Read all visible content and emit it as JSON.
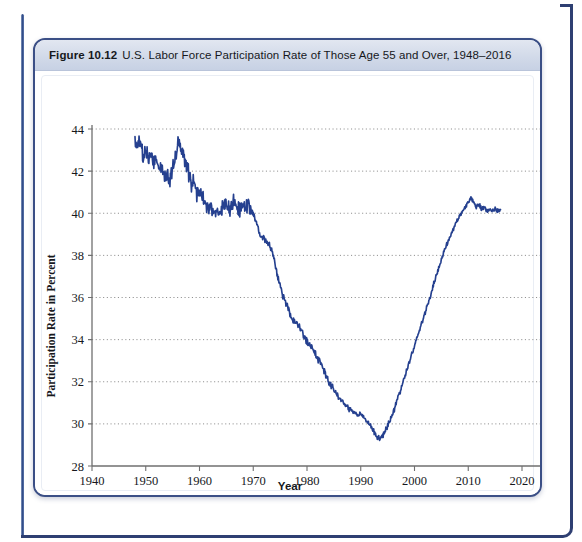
{
  "figure": {
    "number": "Figure 10.12",
    "title": "U.S. Labor Force Participation Rate of Those Age 55 and Over, 1948–2016"
  },
  "colors": {
    "line": "#25408f",
    "grid": "#8b8b8b",
    "axis": "#6f6f6f",
    "card_border": "#3b4f86",
    "header_band": "#d2dae9",
    "page_rule": "#2f4a86"
  },
  "chart_data": {
    "type": "line",
    "title": "U.S. Labor Force Participation Rate of Those Age 55 and Over, 1948–2016",
    "xlabel": "Year",
    "ylabel": "Participation Rate in Percent",
    "xlim": [
      1940,
      2020
    ],
    "ylim": [
      28,
      44
    ],
    "xticks": [
      1940,
      1950,
      1960,
      1970,
      1980,
      1990,
      2000,
      2010,
      2020
    ],
    "yticks": [
      28,
      30,
      32,
      34,
      36,
      38,
      40,
      42,
      44
    ],
    "grid": "horizontal-dotted",
    "legend": "none",
    "series": [
      {
        "name": "Participation Rate, Age 55 and Over",
        "color": "#25408f",
        "x": [
          1948.0,
          1948.5,
          1949.0,
          1949.5,
          1950.0,
          1950.5,
          1951.0,
          1951.5,
          1952.0,
          1952.5,
          1953.0,
          1953.5,
          1954.0,
          1954.5,
          1955.0,
          1955.5,
          1956.0,
          1956.5,
          1957.0,
          1957.5,
          1958.0,
          1958.5,
          1959.0,
          1959.5,
          1960.0,
          1960.5,
          1961.0,
          1961.5,
          1962.0,
          1962.5,
          1963.0,
          1963.5,
          1964.0,
          1964.5,
          1965.0,
          1965.5,
          1966.0,
          1966.5,
          1967.0,
          1967.5,
          1968.0,
          1968.5,
          1969.0,
          1969.5,
          1970.0,
          1970.5,
          1971.0,
          1971.5,
          1972.0,
          1972.5,
          1973.0,
          1973.5,
          1974.0,
          1974.5,
          1975.0,
          1975.5,
          1976.0,
          1976.5,
          1977.0,
          1977.5,
          1978.0,
          1978.5,
          1979.0,
          1979.5,
          1980.0,
          1980.5,
          1981.0,
          1981.5,
          1982.0,
          1982.5,
          1983.0,
          1983.5,
          1984.0,
          1984.5,
          1985.0,
          1985.5,
          1986.0,
          1986.5,
          1987.0,
          1987.5,
          1988.0,
          1988.5,
          1989.0,
          1989.5,
          1990.0,
          1990.5,
          1991.0,
          1991.5,
          1992.0,
          1992.5,
          1993.0,
          1993.5,
          1994.0,
          1994.5,
          1995.0,
          1995.5,
          1996.0,
          1996.5,
          1997.0,
          1997.5,
          1998.0,
          1998.5,
          1999.0,
          1999.5,
          2000.0,
          2000.5,
          2001.0,
          2001.5,
          2002.0,
          2002.5,
          2003.0,
          2003.5,
          2004.0,
          2004.5,
          2005.0,
          2005.5,
          2006.0,
          2006.5,
          2007.0,
          2007.5,
          2008.0,
          2008.5,
          2009.0,
          2009.5,
          2010.0,
          2010.5,
          2011.0,
          2011.5,
          2012.0,
          2012.5,
          2013.0,
          2013.5,
          2014.0,
          2014.5,
          2015.0,
          2015.5,
          2016.0
        ],
        "y": [
          43.4,
          43.2,
          43.4,
          42.6,
          43.1,
          42.4,
          42.9,
          42.4,
          42.7,
          42.0,
          42.4,
          41.6,
          41.9,
          41.5,
          42.3,
          42.6,
          43.3,
          43.1,
          42.8,
          42.3,
          41.9,
          41.3,
          41.5,
          41.0,
          41.2,
          40.8,
          40.5,
          40.2,
          40.4,
          40.1,
          39.9,
          40.0,
          40.2,
          40.4,
          40.5,
          40.2,
          40.4,
          40.6,
          40.3,
          40.1,
          40.4,
          40.2,
          40.5,
          40.2,
          40.0,
          39.6,
          39.2,
          38.8,
          38.9,
          38.6,
          38.5,
          38.2,
          37.6,
          37.0,
          36.6,
          36.1,
          35.8,
          35.5,
          35.1,
          34.9,
          34.8,
          34.6,
          34.4,
          34.1,
          33.9,
          33.7,
          33.6,
          33.4,
          33.1,
          32.9,
          32.6,
          32.3,
          32.0,
          31.8,
          31.6,
          31.4,
          31.2,
          31.1,
          30.9,
          30.8,
          30.7,
          30.6,
          30.5,
          30.4,
          30.5,
          30.3,
          30.2,
          30.0,
          29.8,
          29.6,
          29.4,
          29.3,
          29.4,
          29.6,
          29.9,
          30.2,
          30.5,
          30.9,
          31.3,
          31.7,
          32.1,
          32.5,
          32.9,
          33.3,
          33.7,
          34.1,
          34.5,
          34.9,
          35.3,
          35.7,
          36.1,
          36.6,
          37.0,
          37.4,
          37.8,
          38.2,
          38.5,
          38.8,
          39.1,
          39.4,
          39.7,
          39.9,
          40.1,
          40.3,
          40.5,
          40.7,
          40.5,
          40.3,
          40.4,
          40.2,
          40.3,
          40.1,
          40.2,
          40.1,
          40.2,
          40.1,
          40.2
        ],
        "start_value": 43.4,
        "peak_value": 43.5,
        "peak_year": 1956,
        "trough_value": 29.3,
        "trough_year": 1993,
        "end_value": 40.2,
        "end_year": 2016
      }
    ]
  }
}
